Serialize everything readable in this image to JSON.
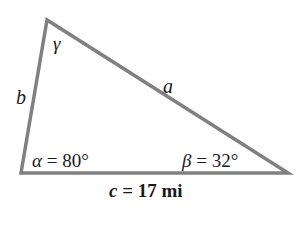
{
  "diagram": {
    "type": "triangle",
    "line_color": "#808080",
    "vertices": {
      "gamma_vertex": [
        47,
        20
      ],
      "alpha_vertex": [
        21,
        173
      ],
      "beta_vertex": [
        288,
        173
      ]
    },
    "sides": {
      "a": {
        "label": "a"
      },
      "b": {
        "label": "b"
      },
      "c": {
        "var": "c",
        "eq": " = 17 mi"
      }
    },
    "angles": {
      "gamma": {
        "symbol": "γ"
      },
      "alpha": {
        "symbol": "α",
        "value": " = 80°"
      },
      "beta": {
        "symbol": "β",
        "value": " = 32°"
      }
    }
  }
}
